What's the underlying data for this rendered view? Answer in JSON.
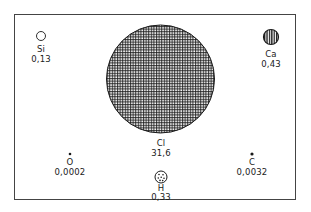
{
  "diagram": {
    "type": "proportional-circles",
    "frame": true,
    "elements": [
      {
        "symbol": "Si",
        "value": "0,13",
        "fill": "open",
        "cx": 41,
        "cy": 36,
        "r": 4.5,
        "label_x": 41,
        "label_y": 44
      },
      {
        "symbol": "Ca",
        "value": "0,43",
        "fill": "vertical-lines",
        "cx": 271,
        "cy": 37,
        "r": 7.5,
        "label_x": 271,
        "label_y": 49
      },
      {
        "symbol": "Cl",
        "value": "31,6",
        "fill": "crosshatch",
        "cx": 160.5,
        "cy": 79,
        "r": 54,
        "label_x": 161,
        "label_y": 138
      },
      {
        "symbol": "O",
        "value": "0,0002",
        "fill": "solid-dot",
        "cx": 70,
        "cy": 154,
        "r": 1.3,
        "label_x": 70,
        "label_y": 157
      },
      {
        "symbol": "C",
        "value": "0,0032",
        "fill": "solid-dot",
        "cx": 252,
        "cy": 154,
        "r": 1.6,
        "label_x": 252,
        "label_y": 157
      },
      {
        "symbol": "H",
        "value": "0,33",
        "fill": "dotted",
        "cx": 161,
        "cy": 177,
        "r": 6,
        "label_x": 161,
        "label_y": 184
      }
    ],
    "colors": {
      "ink": "#1a1a1a",
      "frame": "#444444",
      "background": "#ffffff"
    }
  }
}
